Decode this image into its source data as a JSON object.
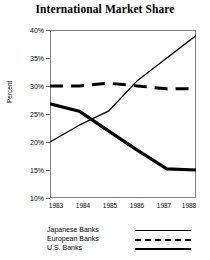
{
  "chart_data": {
    "type": "line",
    "title": "International Market Share",
    "xlabel": "",
    "ylabel": "Percent",
    "categories": [
      "1983",
      "1984",
      "1985",
      "1986",
      "1987",
      "1988"
    ],
    "x": [
      1983,
      1984,
      1985,
      1986,
      1987,
      1988
    ],
    "ylim": [
      10,
      40
    ],
    "yticks": [
      "10%",
      "15%",
      "20%",
      "25%",
      "30%",
      "35%",
      "40%"
    ],
    "ytick_values": [
      10,
      15,
      20,
      25,
      30,
      35,
      40
    ],
    "grid": false,
    "legend_position": "below",
    "series": [
      {
        "name": "Japanese Banks",
        "style": "thin-solid",
        "color": "#000000",
        "values": [
          20.0,
          23.0,
          25.5,
          31.0,
          35.0,
          39.0
        ]
      },
      {
        "name": "European Banks",
        "style": "dashed",
        "color": "#000000",
        "values": [
          30.0,
          30.0,
          30.5,
          30.0,
          29.5,
          29.5
        ]
      },
      {
        "name": "U.S. Banks",
        "style": "thick-solid",
        "color": "#000000",
        "values": [
          26.8,
          25.5,
          22.0,
          18.5,
          15.2,
          15.0
        ]
      }
    ]
  },
  "legend": {
    "items": [
      {
        "label": "Japanese Banks",
        "style": "thin-solid"
      },
      {
        "label": "European Banks",
        "style": "dashed"
      },
      {
        "label": "U.S. Banks",
        "style": "thick-solid"
      }
    ]
  },
  "colors": {
    "ink": "#000000",
    "frame": "#808080",
    "background": "#ffffff"
  }
}
